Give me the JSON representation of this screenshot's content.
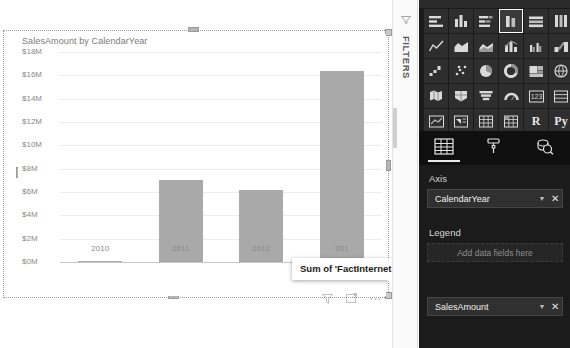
{
  "canvas": {
    "visual_title": "SalesAmount by CalendarYear",
    "tooltip_text": "Sum of 'FactInternetSales'[SalesAmount]",
    "footer_icons": [
      "filter-icon",
      "focus-mode-icon",
      "more-options-icon"
    ]
  },
  "chart_data": {
    "type": "bar",
    "title": "SalesAmount by CalendarYear",
    "categories": [
      "2010",
      "2011",
      "2012",
      "201"
    ],
    "values": [
      0.04,
      7.0,
      6.15,
      16.35
    ],
    "value_unit": "M",
    "xlabel": "",
    "ylabel": "",
    "ylim": [
      0,
      18
    ],
    "ytick_labels": [
      "$18M",
      "$16M",
      "$14M",
      "$12M",
      "$10M",
      "$8M",
      "$6M",
      "$4M",
      "$2M",
      "$0M"
    ],
    "ytick_values": [
      18,
      16,
      14,
      12,
      10,
      8,
      6,
      4,
      2,
      0
    ],
    "grid": true,
    "legend": null,
    "series_color": "#a9a9a9"
  },
  "filters_pane": {
    "label": "FILTERS",
    "icon": "filter-funnel-icon"
  },
  "viz_pane": {
    "gallery": [
      {
        "name": "stacked-bar-chart",
        "selected": false
      },
      {
        "name": "stacked-column-chart",
        "selected": false
      },
      {
        "name": "clustered-bar-chart",
        "selected": false
      },
      {
        "name": "clustered-column-chart",
        "selected": true
      },
      {
        "name": "100-stacked-bar-chart",
        "selected": false
      },
      {
        "name": "100-stacked-column-chart",
        "selected": false
      },
      {
        "name": "line-chart",
        "selected": false
      },
      {
        "name": "area-chart",
        "selected": false
      },
      {
        "name": "stacked-area-chart",
        "selected": false
      },
      {
        "name": "line-and-stacked-column-chart",
        "selected": false
      },
      {
        "name": "line-and-clustered-column-chart",
        "selected": false
      },
      {
        "name": "ribbon-chart",
        "selected": false
      },
      {
        "name": "waterfall-chart",
        "selected": false
      },
      {
        "name": "scatter-chart",
        "selected": false
      },
      {
        "name": "pie-chart",
        "selected": false
      },
      {
        "name": "donut-chart",
        "selected": false
      },
      {
        "name": "treemap",
        "selected": false
      },
      {
        "name": "map",
        "selected": false
      },
      {
        "name": "filled-map",
        "selected": false
      },
      {
        "name": "shape-map",
        "selected": false
      },
      {
        "name": "funnel-chart",
        "selected": false
      },
      {
        "name": "gauge-chart",
        "selected": false
      },
      {
        "name": "card",
        "selected": false
      },
      {
        "name": "multi-row-card",
        "selected": false
      },
      {
        "name": "kpi",
        "selected": false
      },
      {
        "name": "slicer",
        "selected": false
      },
      {
        "name": "table",
        "selected": false
      },
      {
        "name": "matrix",
        "selected": false
      },
      {
        "name": "r-script-visual",
        "selected": false,
        "text": "R"
      },
      {
        "name": "python-visual",
        "selected": false,
        "text": "Py"
      }
    ],
    "more_label": "...",
    "tabs": [
      {
        "name": "fields-tab",
        "icon": "table-icon",
        "active": true
      },
      {
        "name": "format-tab",
        "icon": "paint-roller-icon",
        "active": false
      },
      {
        "name": "analytics-tab",
        "icon": "magnifier-icon",
        "active": false
      }
    ],
    "wells": [
      {
        "label": "Axis",
        "field": "CalendarYear",
        "placeholder": null,
        "caret": "▼",
        "remove": "✕"
      },
      {
        "label": "Legend",
        "field": null,
        "placeholder": "Add data fields here"
      },
      {
        "label": "",
        "field": "SalesAmount",
        "placeholder": null,
        "caret": "▼",
        "remove": "✕"
      }
    ]
  }
}
